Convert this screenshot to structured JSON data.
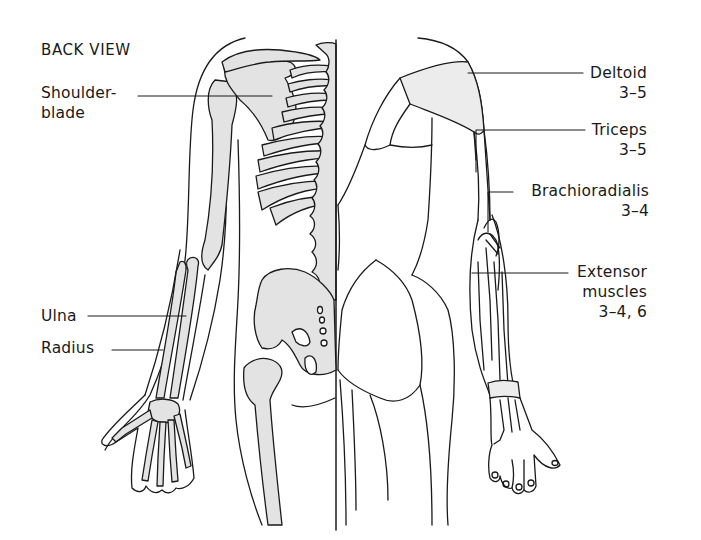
{
  "figure": {
    "title": "BACK VIEW",
    "left_labels": [
      {
        "id": "shoulder-blade",
        "line1": "Shoulder-",
        "line2": "blade"
      },
      {
        "id": "ulna",
        "line1": "Ulna"
      },
      {
        "id": "radius",
        "line1": "Radius"
      }
    ],
    "right_labels": [
      {
        "id": "deltoid",
        "name": "Deltoid",
        "value": "3–5"
      },
      {
        "id": "triceps",
        "name": "Triceps",
        "value": "3–5"
      },
      {
        "id": "brachioradialis",
        "name": "Brachioradialis",
        "value": "3–4"
      },
      {
        "id": "extensor",
        "name": "Extensor",
        "name2": "muscles",
        "value": "3–4, 6"
      }
    ],
    "colors": {
      "bone": "#e3e3e3",
      "muscle": "#ececec",
      "line": "#1a1a1a",
      "background": "#ffffff"
    }
  }
}
